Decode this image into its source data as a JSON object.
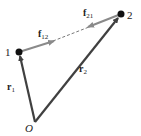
{
  "diagram": {
    "points": [
      {
        "id": "1",
        "label": "1",
        "x": 19,
        "y": 52
      },
      {
        "id": "2",
        "label": "2",
        "x": 121,
        "y": 14
      },
      {
        "id": "O",
        "label": "O",
        "x": 35,
        "y": 122
      }
    ],
    "vectors": [
      {
        "name": "r1",
        "base": "r",
        "sub": "1",
        "from": "O",
        "to": "1",
        "color": "#404040"
      },
      {
        "name": "r2",
        "base": "r",
        "sub": "2",
        "from": "O",
        "to": "2",
        "color": "#404040"
      },
      {
        "name": "f12",
        "base": "f",
        "sub": "12",
        "from": "1",
        "toward": "2",
        "color": "#8a8a8a"
      },
      {
        "name": "f21",
        "base": "f",
        "sub": "21",
        "from": "2",
        "toward": "1",
        "color": "#8a8a8a"
      }
    ],
    "connector": {
      "style": "dashed",
      "between": [
        "1",
        "2"
      ]
    },
    "labels": {
      "point1": "1",
      "point2": "2",
      "origin": "O",
      "f12_base": "f",
      "f12_sub": "12",
      "f21_base": "f",
      "f21_sub": "21",
      "r1_base": "r",
      "r1_sub": "1",
      "r2_base": "r",
      "r2_sub": "2"
    }
  }
}
